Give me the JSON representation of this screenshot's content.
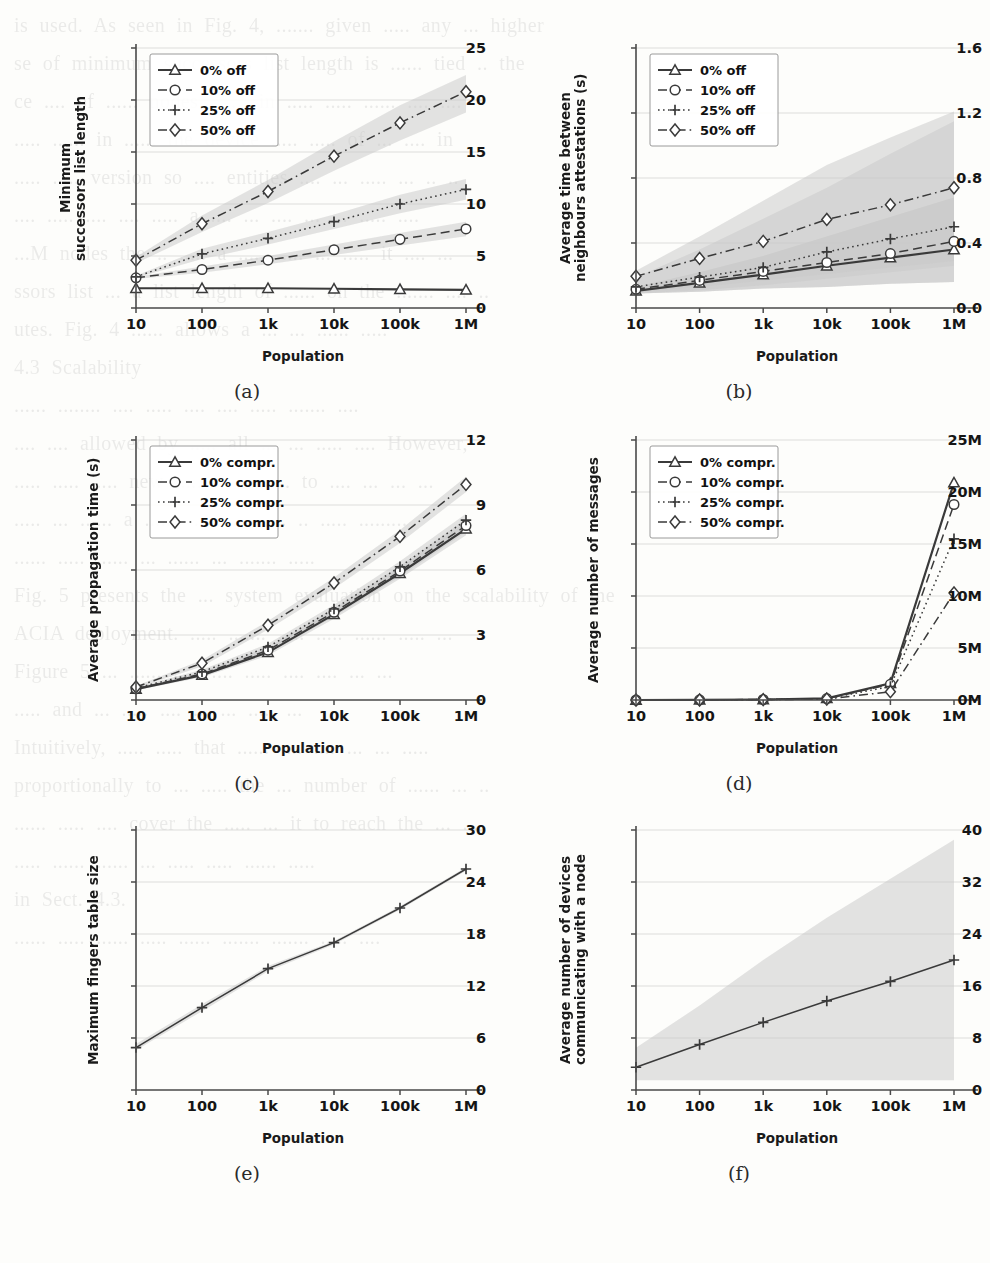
{
  "page": {
    "background_color": "#fdfdfb",
    "line_color": "#3a3a3a",
    "band_color": "#c9c9c9",
    "grid_color": "#cfcfcf"
  },
  "bleed_text": [
    "is used. As seen in Fig. 4, ....... given ..... any ... higher",
    "se of minimum successors list length is ...... tied .. the",
    "ce .... of ...... nodes ....... in ..... ..... ...... .... ....",
    "..... ...... in ...... the device ..... ..... of ... .... in",
    "..... ..... version so .... entities .... ... ..... ... .. ..",
    "",
    ".... ..... .... .... ..... a .... ... .... ... ... ..... ....",
    "...M nodes the .. ..... a ..... ..... ... ..... it .... ...",
    "ssors list ... a list length of ...... on the ....... .... ..",
    "utes. Fig. 4 ...... allows a ... ... ...... .....",
    "",
    "4.3 Scalability",
    "",
    "...... ........ .... ..... .... .... ..... ....... ....",
    ".... .... allowed by ..... all ... ... ..... .... However,",
    "..... ..... ..... new ..... .. ... ..... to .... ... ... ...",
    "",
    "..... ... ...... a ....... .. ..... ...... .. ..... .........",
    "...... ..... ...... ... ...... ... ....... .....",
    "",
    "Fig. 5 presents the ... system evaluation on the scalability of the",
    "ACIA deployment. ..... ....... ..... ..... ...... ..... ...",
    "",
    "Figure 5 ... ...... ..... .... ..... .... .... ... ...",
    "..... and ... ..... .... ... ... ..... ...",
    "",
    "Intuitively, ..... ..... that ...... .... .... ... ... .....",
    "proportionally to ... ..... the ... number of ...... ... ..",
    "...... ..... .... cover the ..... ... it to reach the ... ...",
    "..... ...... ...... ... ..... ..... ...... .....",
    "",
    "in Sect. 4.3.",
    "",
    "...... ..... ...... ..... ...... .......  ....... ..... ...."
  ],
  "shared": {
    "xlabel": "Population",
    "xticks": [
      "10",
      "100",
      "1k",
      "10k",
      "100k",
      "1M"
    ]
  },
  "chart_data": [
    {
      "id": "a",
      "caption": "(a)",
      "type": "line",
      "title": "",
      "xlabel": "Population",
      "ylabel": "Minimum\nsuccessors list length",
      "x": [
        "10",
        "100",
        "1k",
        "10k",
        "100k",
        "1M"
      ],
      "ylim": [
        0,
        25
      ],
      "yticks": [
        0,
        5,
        10,
        15,
        20,
        25
      ],
      "ytick_labels": [
        "0",
        "5",
        "10",
        "15",
        "20",
        "25"
      ],
      "grid": true,
      "legend_position": "upper-left",
      "series": [
        {
          "name": "0% off",
          "marker": "triangle",
          "dash": "none",
          "values": [
            1.9,
            1.9,
            1.9,
            1.85,
            1.8,
            1.75
          ],
          "band_lo": [
            1.9,
            1.9,
            1.9,
            1.85,
            1.8,
            1.75
          ],
          "band_hi": [
            1.9,
            1.9,
            1.9,
            1.85,
            1.8,
            1.75
          ]
        },
        {
          "name": "10% off",
          "marker": "circle",
          "dash": "dashed",
          "values": [
            2.9,
            3.7,
            4.6,
            5.6,
            6.6,
            7.6
          ],
          "band_lo": [
            2.8,
            3.4,
            4.2,
            5.1,
            6.0,
            6.9
          ],
          "band_hi": [
            3.0,
            4.0,
            5.0,
            6.1,
            7.2,
            8.3
          ]
        },
        {
          "name": "25% off",
          "marker": "plus",
          "dash": "dotted",
          "values": [
            3.0,
            5.2,
            6.7,
            8.3,
            10.0,
            11.4
          ],
          "band_lo": [
            2.9,
            4.7,
            6.1,
            7.6,
            9.1,
            10.4
          ],
          "band_hi": [
            3.1,
            5.7,
            7.3,
            9.0,
            10.9,
            12.4
          ]
        },
        {
          "name": "50% off",
          "marker": "diamond",
          "dash": "dashdot",
          "values": [
            4.6,
            8.1,
            11.2,
            14.6,
            17.8,
            20.8
          ],
          "band_lo": [
            4.3,
            7.3,
            10.1,
            13.2,
            16.1,
            18.8
          ],
          "band_hi": [
            4.9,
            8.9,
            12.3,
            16.0,
            19.5,
            22.4
          ]
        }
      ]
    },
    {
      "id": "b",
      "caption": "(b)",
      "type": "line",
      "title": "",
      "xlabel": "Population",
      "ylabel": "Average time between\nneighbours attestations (s)",
      "x": [
        "10",
        "100",
        "1k",
        "10k",
        "100k",
        "1M"
      ],
      "ylim": [
        0,
        1.6
      ],
      "yticks": [
        0,
        0.4,
        0.8,
        1.2,
        1.6
      ],
      "ytick_labels": [
        "0.0",
        "0.4",
        "0.8",
        "1.2",
        "1.6"
      ],
      "grid": true,
      "legend_position": "upper-left",
      "series": [
        {
          "name": "0% off",
          "marker": "triangle",
          "dash": "none",
          "values": [
            0.105,
            0.155,
            0.205,
            0.26,
            0.31,
            0.36
          ],
          "band_lo": [
            0.09,
            0.1,
            0.12,
            0.13,
            0.15,
            0.16
          ],
          "band_hi": [
            0.13,
            0.22,
            0.32,
            0.44,
            0.56,
            0.68
          ]
        },
        {
          "name": "10% off",
          "marker": "circle",
          "dash": "dashed",
          "values": [
            0.115,
            0.17,
            0.225,
            0.28,
            0.335,
            0.41
          ],
          "band_lo": [
            0.09,
            0.1,
            0.12,
            0.13,
            0.15,
            0.16
          ],
          "band_hi": [
            0.13,
            0.22,
            0.32,
            0.44,
            0.56,
            0.68
          ]
        },
        {
          "name": "25% off",
          "marker": "plus",
          "dash": "dotted",
          "values": [
            0.13,
            0.19,
            0.25,
            0.345,
            0.425,
            0.5
          ],
          "band_lo": [
            0.09,
            0.11,
            0.14,
            0.18,
            0.22,
            0.26
          ],
          "band_hi": [
            0.19,
            0.36,
            0.55,
            0.74,
            0.95,
            1.15
          ]
        },
        {
          "name": "50% off",
          "marker": "diamond",
          "dash": "dashdot",
          "values": [
            0.195,
            0.305,
            0.41,
            0.545,
            0.635,
            0.74
          ],
          "band_lo": [
            0.1,
            0.13,
            0.17,
            0.21,
            0.25,
            0.29
          ],
          "band_hi": [
            0.23,
            0.44,
            0.66,
            0.88,
            1.05,
            1.21
          ]
        }
      ]
    },
    {
      "id": "c",
      "caption": "(c)",
      "type": "line",
      "title": "",
      "xlabel": "Population",
      "ylabel": "Average propagation time (s)",
      "x": [
        "10",
        "100",
        "1k",
        "10k",
        "100k",
        "1M"
      ],
      "ylim": [
        0,
        12
      ],
      "yticks": [
        0,
        3,
        6,
        9,
        12
      ],
      "ytick_labels": [
        "0",
        "3",
        "6",
        "9",
        "12"
      ],
      "grid": true,
      "legend_position": "upper-left",
      "series": [
        {
          "name": "0% compr.",
          "marker": "triangle",
          "dash": "none",
          "values": [
            0.5,
            1.15,
            2.2,
            3.95,
            5.85,
            7.9
          ],
          "band_lo": [
            0.45,
            1.05,
            2.05,
            3.75,
            5.6,
            7.6
          ],
          "band_hi": [
            0.55,
            1.25,
            2.35,
            4.15,
            6.1,
            8.2
          ]
        },
        {
          "name": "10% compr.",
          "marker": "circle",
          "dash": "dashed",
          "values": [
            0.52,
            1.2,
            2.3,
            4.05,
            5.95,
            8.05
          ],
          "band_lo": [
            0.47,
            1.1,
            2.15,
            3.85,
            5.7,
            7.75
          ],
          "band_hi": [
            0.57,
            1.3,
            2.45,
            4.25,
            6.2,
            8.35
          ]
        },
        {
          "name": "25% compr.",
          "marker": "plus",
          "dash": "dotted",
          "values": [
            0.55,
            1.3,
            2.45,
            4.2,
            6.15,
            8.3
          ],
          "band_lo": [
            0.5,
            1.2,
            2.3,
            4.0,
            5.9,
            8.0
          ],
          "band_hi": [
            0.6,
            1.4,
            2.6,
            4.4,
            6.4,
            8.6
          ]
        },
        {
          "name": "50% compr.",
          "marker": "diamond",
          "dash": "dashdot",
          "values": [
            0.6,
            1.7,
            3.45,
            5.4,
            7.55,
            9.95
          ],
          "band_lo": [
            0.55,
            1.55,
            3.25,
            5.15,
            7.25,
            9.6
          ],
          "band_hi": [
            0.65,
            1.85,
            3.65,
            5.65,
            7.85,
            10.3
          ]
        }
      ]
    },
    {
      "id": "d",
      "caption": "(d)",
      "type": "line",
      "title": "",
      "xlabel": "Population",
      "ylabel": "Average number of messages",
      "x": [
        "10",
        "100",
        "1k",
        "10k",
        "100k",
        "1M"
      ],
      "ylim": [
        0,
        25
      ],
      "yticks": [
        0,
        5,
        10,
        15,
        20,
        25
      ],
      "ytick_labels": [
        "0M",
        "5M",
        "10M",
        "15M",
        "20M",
        "25M"
      ],
      "unit": "M",
      "grid": true,
      "legend_position": "upper-left",
      "series": [
        {
          "name": "0% compr.",
          "marker": "triangle",
          "dash": "none",
          "values": [
            0.0,
            0.01,
            0.05,
            0.15,
            1.6,
            20.9
          ],
          "band_lo": [
            0.0,
            0.01,
            0.05,
            0.15,
            1.6,
            20.9
          ],
          "band_hi": [
            0.0,
            0.01,
            0.05,
            0.15,
            1.6,
            20.9
          ]
        },
        {
          "name": "10% compr.",
          "marker": "circle",
          "dash": "dashed",
          "values": [
            0.0,
            0.01,
            0.05,
            0.14,
            1.5,
            18.8
          ],
          "band_lo": [
            0.0,
            0.01,
            0.05,
            0.14,
            1.5,
            18.8
          ],
          "band_hi": [
            0.0,
            0.01,
            0.05,
            0.14,
            1.5,
            18.8
          ]
        },
        {
          "name": "25% compr.",
          "marker": "plus",
          "dash": "dotted",
          "values": [
            0.0,
            0.01,
            0.04,
            0.12,
            1.3,
            15.5
          ],
          "band_lo": [
            0.0,
            0.01,
            0.04,
            0.12,
            1.3,
            15.5
          ],
          "band_hi": [
            0.0,
            0.01,
            0.04,
            0.12,
            1.3,
            15.5
          ]
        },
        {
          "name": "50% compr.",
          "marker": "diamond",
          "dash": "dashdot",
          "values": [
            0.0,
            0.0,
            0.03,
            0.09,
            0.8,
            10.3
          ],
          "band_lo": [
            0.0,
            0.0,
            0.03,
            0.09,
            0.8,
            10.3
          ],
          "band_hi": [
            0.0,
            0.0,
            0.03,
            0.09,
            0.8,
            10.3
          ]
        }
      ]
    },
    {
      "id": "e",
      "caption": "(e)",
      "type": "line",
      "title": "",
      "xlabel": "Population",
      "ylabel": "Maximum fingers table size",
      "x": [
        "10",
        "100",
        "1k",
        "10k",
        "100k",
        "1M"
      ],
      "ylim": [
        0,
        30
      ],
      "yticks": [
        0,
        6,
        12,
        18,
        24,
        30
      ],
      "ytick_labels": [
        "0",
        "6",
        "12",
        "18",
        "24",
        "30"
      ],
      "grid": true,
      "legend_position": "none",
      "series": [
        {
          "name": "",
          "marker": "plus",
          "dash": "none",
          "values": [
            4.9,
            9.5,
            14.0,
            17.0,
            21.0,
            25.5
          ],
          "band_lo": [
            4.6,
            9.1,
            13.7,
            16.8,
            20.8,
            25.3
          ],
          "band_hi": [
            5.3,
            9.9,
            14.3,
            17.2,
            21.2,
            25.7
          ]
        }
      ]
    },
    {
      "id": "f",
      "caption": "(f)",
      "type": "line",
      "title": "",
      "xlabel": "Population",
      "ylabel": "Average number of devices\ncommunicating with a node",
      "x": [
        "10",
        "100",
        "1k",
        "10k",
        "100k",
        "1M"
      ],
      "ylim": [
        0,
        40
      ],
      "yticks": [
        0,
        8,
        16,
        24,
        32,
        40
      ],
      "ytick_labels": [
        "0",
        "8",
        "16",
        "24",
        "32",
        "40"
      ],
      "grid": true,
      "legend_position": "none",
      "series": [
        {
          "name": "",
          "marker": "plus",
          "dash": "none",
          "values": [
            3.5,
            7.0,
            10.4,
            13.7,
            16.7,
            20.0
          ],
          "band_lo": [
            1.5,
            1.5,
            1.5,
            1.5,
            1.5,
            1.5
          ],
          "band_hi": [
            6.5,
            13.0,
            20.0,
            26.5,
            32.5,
            38.5
          ]
        }
      ]
    }
  ]
}
